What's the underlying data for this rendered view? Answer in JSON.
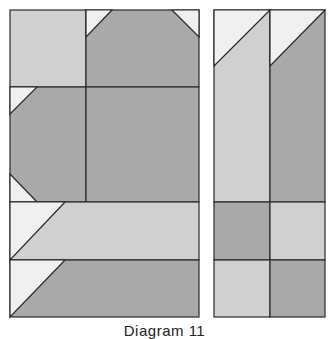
{
  "caption": "Diagram 11",
  "colors": {
    "light": "#d0d0d0",
    "dark": "#a9a9a9",
    "white": "#f0f0f0",
    "line": "#2a2a2a"
  },
  "blocks": [
    {
      "name": "left-quilt-block",
      "x": 10,
      "y": 10,
      "width": 189,
      "height": 307
    },
    {
      "name": "right-quilt-block",
      "x": 214,
      "y": 10,
      "width": 111,
      "height": 307
    }
  ]
}
